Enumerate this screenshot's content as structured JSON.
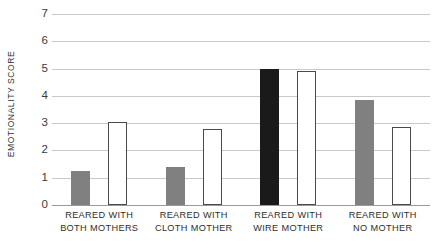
{
  "chart_data": {
    "type": "bar",
    "title": "",
    "xlabel": "",
    "ylabel": "EMOTIONALITY SCORE",
    "ylim": [
      0,
      7
    ],
    "yticks": [
      0,
      1,
      2,
      3,
      4,
      5,
      6,
      7
    ],
    "grid": true,
    "legend": "none",
    "categories": [
      "REARED WITH BOTH MOTHERS",
      "REARED WITH CLOTH MOTHER",
      "REARED WITH WIRE MOTHER",
      "REARED WITH NO MOTHER"
    ],
    "category_lines": [
      [
        "REARED WITH",
        "BOTH MOTHERS"
      ],
      [
        "REARED WITH",
        "CLOTH MOTHER"
      ],
      [
        "REARED WITH",
        "WIRE MOTHER"
      ],
      [
        "REARED WITH",
        "NO MOTHER"
      ]
    ],
    "series": [
      {
        "name": "filled",
        "style": "filled",
        "values": [
          1.25,
          1.4,
          5.0,
          3.85
        ],
        "colors": [
          "#808080",
          "#808080",
          "#1a1a1a",
          "#808080"
        ]
      },
      {
        "name": "open",
        "style": "outline",
        "values": [
          3.05,
          2.8,
          4.9,
          2.85
        ],
        "colors": [
          "#ffffff",
          "#ffffff",
          "#ffffff",
          "#ffffff"
        ]
      }
    ],
    "colors": {
      "gridline": "#c9c9c9",
      "baseline": "#9a9a9a",
      "bar_gray": "#808080",
      "bar_black": "#1a1a1a",
      "bar_outline_stroke": "#4a4a4a",
      "text": "#2e2e2e",
      "background": "#ffffff"
    }
  }
}
